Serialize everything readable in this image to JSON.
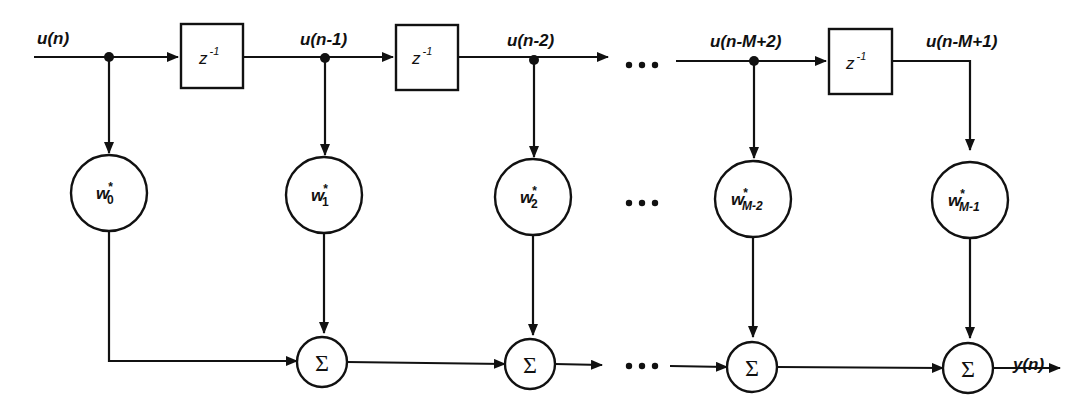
{
  "diagram": {
    "type": "tapped-delay-line FIR transversal filter",
    "input_signal": "u(n)",
    "output_signal": "y(n)",
    "delay_label": {
      "base": "z",
      "exponent": "-1"
    },
    "tap_signals": [
      "u(n)",
      "u(n-1)",
      "u(n-2)",
      "u(n-M+2)",
      "u(n-M+1)"
    ],
    "weights": [
      {
        "base": "w",
        "conj": "*",
        "sub": "0"
      },
      {
        "base": "w",
        "conj": "*",
        "sub": "1"
      },
      {
        "base": "w",
        "conj": "*",
        "sub": "2"
      },
      {
        "base": "w",
        "conj": "*",
        "sub": "M-2"
      },
      {
        "base": "w",
        "conj": "*",
        "sub": "M-1"
      }
    ],
    "summer_symbol": "Σ",
    "ellipsis": "•••",
    "nodes": {
      "delays": 3,
      "weight_multipliers": 5,
      "summers": 4
    }
  }
}
